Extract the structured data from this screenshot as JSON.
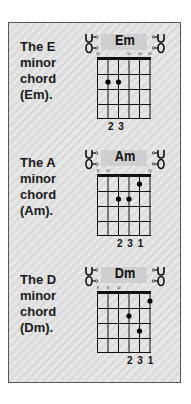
{
  "chords": [
    {
      "label_lines": [
        "The E",
        "minor",
        "chord",
        "(Em)."
      ],
      "name": "Em",
      "string_markers": [
        "o",
        "",
        "",
        "o",
        "o",
        "o"
      ],
      "dots": [
        {
          "string": 2,
          "fret": 2
        },
        {
          "string": 3,
          "fret": 2
        }
      ],
      "fingering": "2 3"
    },
    {
      "label_lines": [
        "The A",
        "minor",
        "chord",
        "(Am)."
      ],
      "name": "Am",
      "string_markers": [
        "x",
        "o",
        "",
        "",
        "",
        "o"
      ],
      "dots": [
        {
          "string": 5,
          "fret": 1
        },
        {
          "string": 3,
          "fret": 2
        },
        {
          "string": 4,
          "fret": 2
        }
      ],
      "fingering": "2 3 1"
    },
    {
      "label_lines": [
        "The D",
        "minor",
        "chord",
        "(Dm)."
      ],
      "name": "Dm",
      "string_markers": [
        "x",
        "x",
        "o",
        "",
        "",
        ""
      ],
      "dots": [
        {
          "string": 6,
          "fret": 1
        },
        {
          "string": 4,
          "fret": 2
        },
        {
          "string": 5,
          "fret": 3
        }
      ],
      "fingering": "2 3 1"
    }
  ],
  "colors": {
    "panel_border": "#555555",
    "grid_line": "#111111",
    "dot": "#000000",
    "header_bg": "#cfcfcf"
  },
  "icons": {
    "tuning_peg_left": "tuning-peg-left-icon",
    "tuning_peg_right": "tuning-peg-right-icon"
  }
}
